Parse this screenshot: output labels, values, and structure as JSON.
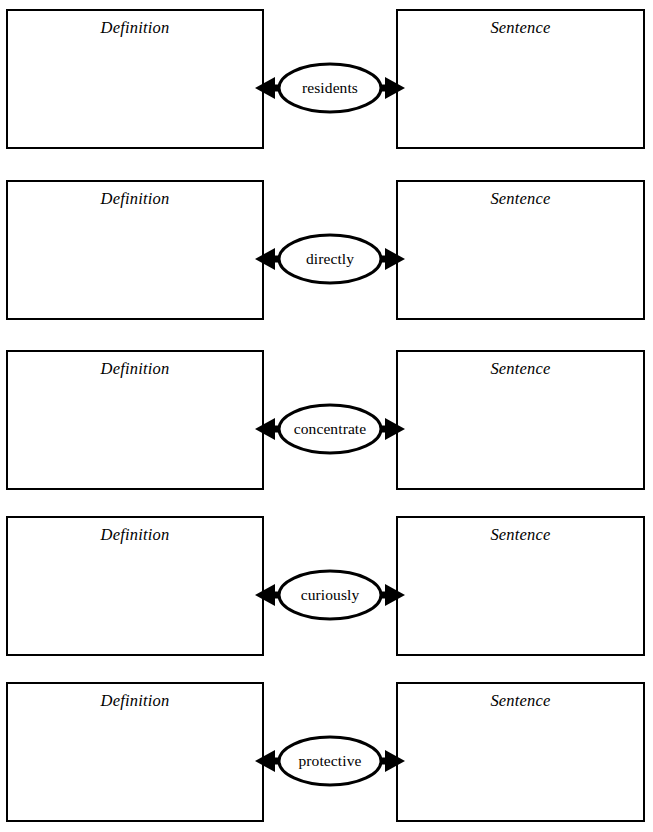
{
  "page": {
    "header_fragment": "",
    "definition_label": "Definition",
    "sentence_label": "Sentence",
    "ink_color": "#000000",
    "background_color": "#ffffff"
  },
  "rows": [
    {
      "word": "residents"
    },
    {
      "word": "directly"
    },
    {
      "word": "concentrate"
    },
    {
      "word": "curiously"
    },
    {
      "word": "protective"
    }
  ]
}
